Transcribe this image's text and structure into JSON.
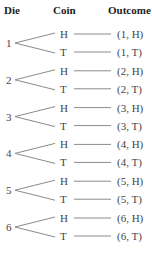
{
  "headers": {
    "die": "Die",
    "coin": "Coin",
    "outcome": "Outcome"
  },
  "colors": {
    "line": "#8a8a8a",
    "text": "#444444",
    "header": "#222222"
  },
  "groups": [
    {
      "die": "1",
      "branches": [
        {
          "coin": "H",
          "outcome": "(1, H)"
        },
        {
          "coin": "T",
          "outcome": "(1, T)"
        }
      ]
    },
    {
      "die": "2",
      "branches": [
        {
          "coin": "H",
          "outcome": "(2, H)"
        },
        {
          "coin": "T",
          "outcome": "(2, T)"
        }
      ]
    },
    {
      "die": "3",
      "branches": [
        {
          "coin": "H",
          "outcome": "(3, H)"
        },
        {
          "coin": "T",
          "outcome": "(3, T)"
        }
      ]
    },
    {
      "die": "4",
      "branches": [
        {
          "coin": "H",
          "outcome": "(4, H)"
        },
        {
          "coin": "T",
          "outcome": "(4, T)"
        }
      ]
    },
    {
      "die": "5",
      "branches": [
        {
          "coin": "H",
          "outcome": "(5, H)"
        },
        {
          "coin": "T",
          "outcome": "(5, T)"
        }
      ]
    },
    {
      "die": "6",
      "branches": [
        {
          "coin": "H",
          "outcome": "(6, H)"
        },
        {
          "coin": "T",
          "outcome": "(6, T)"
        }
      ]
    }
  ]
}
